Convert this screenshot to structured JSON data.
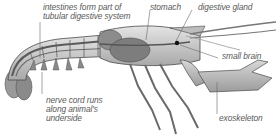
{
  "diagram": {
    "labels": {
      "intestines": [
        "intestines form part of",
        "tubular digestive system"
      ],
      "stomach": "stomach",
      "digestive_gland": "digestive gland",
      "small_brain": "small brain",
      "nerve_cord": [
        "nerve cord runs",
        "along animal's",
        "underside"
      ],
      "exoskeleton": "exoskeleton"
    },
    "colors": {
      "background": "#ffffff",
      "label_text": "#5a5a5a",
      "leader_line": "#6a6a6a",
      "body_shell": "#c9c9c9",
      "body_outline": "#4a4a4a",
      "organs": "#8c8c8c",
      "brain": "#111111"
    }
  }
}
